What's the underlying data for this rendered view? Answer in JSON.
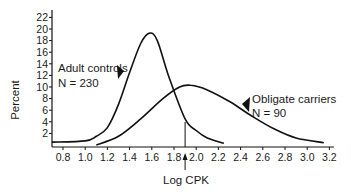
{
  "chart_data": {
    "type": "line",
    "title": "",
    "xlabel": "Log CPK",
    "ylabel": "Percent",
    "xlim": [
      0.7,
      3.2
    ],
    "ylim": [
      0,
      23
    ],
    "grid": false,
    "x_ticks": [
      "0.8",
      "1.0",
      "1.2",
      "1.4",
      "1.6",
      "1.8",
      "2.0",
      "2.2",
      "2.4",
      "2.6",
      "2.8",
      "3.0",
      "3.2"
    ],
    "y_ticks": [
      "2",
      "4",
      "6",
      "8",
      "10",
      "12",
      "14",
      "16",
      "18",
      "20",
      "22"
    ],
    "series": [
      {
        "name": "Adult controls",
        "annotation": [
          "Adult controls",
          "N = 230"
        ],
        "x": [
          0.7,
          1.0,
          1.1,
          1.2,
          1.3,
          1.4,
          1.5,
          1.58,
          1.65,
          1.75,
          1.9,
          2.0,
          2.1,
          2.25
        ],
        "values": [
          0.5,
          0.7,
          1.5,
          3,
          7,
          12.5,
          17.5,
          19.3,
          18,
          12,
          4.5,
          2.5,
          1.2,
          0.3
        ]
      },
      {
        "name": "Obligate carriers",
        "annotation": [
          "Obligate carriers",
          "N = 90"
        ],
        "x": [
          1.1,
          1.3,
          1.5,
          1.7,
          1.85,
          1.95,
          2.1,
          2.3,
          2.5,
          2.7,
          2.9,
          3.15
        ],
        "values": [
          0,
          1.5,
          4.5,
          8,
          10,
          10.3,
          9.5,
          7.5,
          5,
          2.8,
          1.2,
          0.4
        ]
      }
    ],
    "annotations": [
      {
        "type": "vertical-line",
        "x": 1.9,
        "label": "cutoff",
        "arrow_below_axis": true
      }
    ]
  },
  "labels": {
    "ylabel": "Percent",
    "xlabel": "Log CPK",
    "adult_name": "Adult controls",
    "adult_n": "N = 230",
    "carrier_name": "Obligate carriers",
    "carrier_n": "N = 90"
  }
}
